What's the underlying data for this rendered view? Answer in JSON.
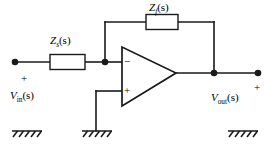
{
  "diagram": {
    "stroke_color": "#1a1a1a",
    "background_color": "#ffffff"
  },
  "components": {
    "input_impedance": {
      "name": "Zs",
      "symbol": "Z",
      "subscript": "s",
      "argument": "(s)",
      "label": "Z",
      "paren": "(s)"
    },
    "feedback_impedance": {
      "name": "Zf",
      "symbol": "Z",
      "subscript": "f",
      "argument": "(s)",
      "label": "Z",
      "paren": "(s)"
    },
    "opamp": {
      "inverting_sign": "−",
      "noninverting_sign": "+"
    }
  },
  "terminals": {
    "input": {
      "symbol": "V",
      "subscript": "in",
      "argument": "(s)",
      "polarity": "+"
    },
    "output": {
      "symbol": "V",
      "subscript": "out",
      "argument": "(s)",
      "polarity": "+"
    }
  },
  "grounds": [
    {
      "id": "ground-input",
      "label": "ground"
    },
    {
      "id": "ground-noninverting",
      "label": "ground"
    },
    {
      "id": "ground-output",
      "label": "ground"
    }
  ]
}
